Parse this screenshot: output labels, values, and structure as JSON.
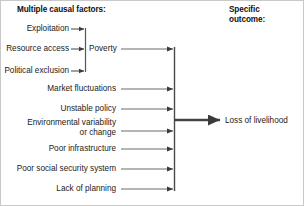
{
  "diagram": {
    "headers": {
      "left": "Multiple causal factors:",
      "right": "Specific\noutcome:"
    },
    "cluster": {
      "label": "Poverty",
      "inputs": [
        {
          "label": "Exploitation"
        },
        {
          "label": "Resource access"
        },
        {
          "label": "Political exclusion"
        }
      ]
    },
    "factors": [
      {
        "label": "Poverty"
      },
      {
        "label": "Market fluctuations"
      },
      {
        "label": "Unstable policy"
      },
      {
        "label": "Environmental variability\nor change"
      },
      {
        "label": "Poor infrastructure"
      },
      {
        "label": "Poor social security system"
      },
      {
        "label": "Lack of planning"
      }
    ],
    "outcome": {
      "label": "Loss of livelihood"
    },
    "colors": {
      "line": "#555555",
      "thick_line": "#444444",
      "text": "#1a1a1a",
      "background": "#ffffff",
      "border": "#c9c9c9"
    }
  }
}
